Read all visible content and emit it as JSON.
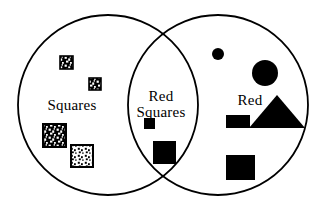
{
  "diagram": {
    "type": "venn",
    "title": "",
    "background_color": "#ffffff",
    "stroke_color": "#000000",
    "fill_color": "#000000",
    "sets": [
      {
        "name": "squares-set",
        "label": "Squares",
        "label_x": 72,
        "label_y": 97,
        "circle": {
          "cx": 108,
          "cy": 105,
          "r": 90
        }
      },
      {
        "name": "red-set",
        "label": "Red",
        "label_x": 250,
        "label_y": 92,
        "circle": {
          "cx": 218,
          "cy": 105,
          "r": 90
        }
      }
    ],
    "intersection": {
      "name": "red-squares-intersection",
      "label_line_1": "Red",
      "label_line_2": "Squares",
      "label_x": 161,
      "label_y": 88
    },
    "shapes": [
      {
        "name": "patterned-square-small-1",
        "region": "squares-only",
        "kind": "square-patterned",
        "x": 60,
        "y": 56,
        "size": 13,
        "pattern": "speckle-light-on-dark"
      },
      {
        "name": "patterned-square-small-2",
        "region": "squares-only",
        "kind": "square-patterned",
        "x": 89,
        "y": 78,
        "size": 12,
        "pattern": "speckle-light-on-dark"
      },
      {
        "name": "patterned-square-large-1",
        "region": "squares-only",
        "kind": "square-patterned",
        "x": 43,
        "y": 124,
        "size": 23,
        "pattern": "speckle-light-on-dark"
      },
      {
        "name": "patterned-square-large-2",
        "region": "squares-only",
        "kind": "square-patterned",
        "x": 71,
        "y": 145,
        "size": 22,
        "pattern": "speckle-dark-on-light"
      },
      {
        "name": "solid-square-small-center",
        "region": "intersection",
        "kind": "square-solid",
        "x": 144,
        "y": 118,
        "size": 11
      },
      {
        "name": "solid-square-large-center",
        "region": "intersection",
        "kind": "square-solid",
        "x": 153,
        "y": 141,
        "size": 23
      },
      {
        "name": "solid-circle-small",
        "region": "red-only",
        "kind": "circle-solid",
        "cx": 218,
        "cy": 54,
        "r": 6
      },
      {
        "name": "solid-circle-large",
        "region": "red-only",
        "kind": "circle-solid",
        "cx": 265,
        "cy": 73,
        "r": 13
      },
      {
        "name": "solid-rect-small",
        "region": "red-only",
        "kind": "rect-solid",
        "x": 226,
        "y": 115,
        "w": 24,
        "h": 13
      },
      {
        "name": "solid-triangle",
        "region": "red-only",
        "kind": "triangle-solid",
        "cx": 277,
        "base_y": 128,
        "half_w": 28,
        "height": 33
      },
      {
        "name": "solid-rect-large",
        "region": "red-only",
        "kind": "rect-solid",
        "x": 226,
        "y": 155,
        "w": 29,
        "h": 25
      }
    ],
    "counts": {
      "squares_only": 4,
      "intersection": 2,
      "red_only": 5
    }
  }
}
